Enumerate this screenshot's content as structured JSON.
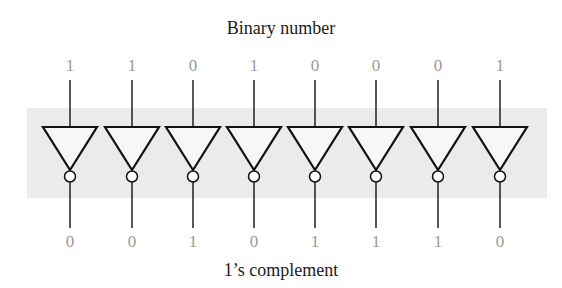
{
  "diagram": {
    "top_label": "Binary number",
    "bottom_label": "1’s complement",
    "input_bits": [
      "1",
      "1",
      "0",
      "1",
      "0",
      "0",
      "0",
      "1"
    ],
    "output_bits": [
      "0",
      "0",
      "1",
      "0",
      "1",
      "1",
      "1",
      "0"
    ],
    "gate_type": "NOT (inverter)",
    "gate_count": 8,
    "colors": {
      "band": "#ebebeb",
      "gate_stroke": "#111111",
      "gate_fill": "#f7f7f7",
      "bit_text": "#9a9a9a",
      "label_text": "#1a1a1a"
    }
  }
}
